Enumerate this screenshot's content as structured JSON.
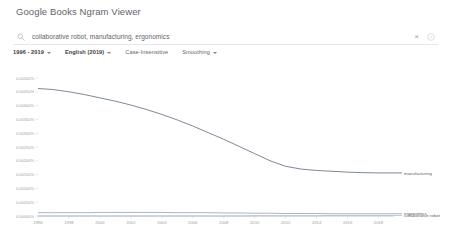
{
  "header": {
    "title_google": "Google",
    "title_rest": " Books Ngram Viewer"
  },
  "search": {
    "icon": "search-icon",
    "value": "collaborative robot, manufacturing, ergonomics",
    "clear_label": "×",
    "help_icon": "help-circle-icon"
  },
  "controls": {
    "year_range": "1996 - 2019",
    "corpus": "English (2019)",
    "case": "Case-Insensitive",
    "smoothing": "Smoothing"
  },
  "chart_data": {
    "type": "line",
    "title": "",
    "xlabel": "",
    "ylabel": "",
    "xlim": [
      1996,
      2019
    ],
    "ylim": [
      0,
      0.005
    ],
    "grid": false,
    "legend_position": "right",
    "ytick_labels": [
      "0.00500%",
      "0.00450%",
      "0.00400%",
      "0.00350%",
      "0.00300%",
      "0.00250%",
      "0.00200%",
      "0.00150%",
      "0.00100%",
      "0.00050%",
      "0.00000%"
    ],
    "ytick_values": [
      0.005,
      0.0045,
      0.004,
      0.0035,
      0.003,
      0.0025,
      0.002,
      0.0015,
      0.001,
      0.0005,
      0.0
    ],
    "xtick_labels": [
      "1996",
      "1998",
      "2000",
      "2002",
      "2004",
      "2006",
      "2008",
      "2010",
      "2012",
      "2014",
      "2016",
      "2018"
    ],
    "xtick_values": [
      1996,
      1998,
      2000,
      2002,
      2004,
      2006,
      2008,
      2010,
      2012,
      2014,
      2016,
      2018
    ],
    "x": [
      1996,
      1997,
      1998,
      1999,
      2000,
      2001,
      2002,
      2003,
      2004,
      2005,
      2006,
      2007,
      2008,
      2009,
      2010,
      2011,
      2012,
      2013,
      2014,
      2015,
      2016,
      2017,
      2018,
      2019
    ],
    "series": [
      {
        "name": "manufacturing",
        "color": "#5b6b7c",
        "values": [
          0.00462,
          0.00458,
          0.0045,
          0.0044,
          0.00428,
          0.00416,
          0.00402,
          0.00386,
          0.00368,
          0.00348,
          0.00326,
          0.00302,
          0.00278,
          0.00252,
          0.00226,
          0.002,
          0.0018,
          0.0017,
          0.00165,
          0.00162,
          0.00159,
          0.00157,
          0.00156,
          0.00156
        ]
      },
      {
        "name": "ergonomics",
        "color": "#8fa3b8",
        "values": [
          0.00012,
          0.00012,
          0.00012,
          0.00012,
          0.00013,
          0.00013,
          0.00013,
          0.00013,
          0.00013,
          0.00012,
          0.00012,
          0.00012,
          0.00011,
          0.00011,
          0.0001,
          0.0001,
          9e-05,
          9e-05,
          9e-05,
          8e-05,
          8e-05,
          8e-05,
          8e-05,
          8e-05
        ]
      },
      {
        "name": "collaborative robot",
        "color": "#b0bfcd",
        "values": [
          0.0,
          0.0,
          0.0,
          0.0,
          0.0,
          0.0,
          0.0,
          0.0,
          0.0,
          0.0,
          0.0,
          0.0,
          0.0,
          0.0,
          1e-05,
          1e-05,
          1e-05,
          1e-05,
          1e-05,
          2e-05,
          2e-05,
          2e-05,
          2e-05,
          2e-05
        ]
      }
    ]
  }
}
